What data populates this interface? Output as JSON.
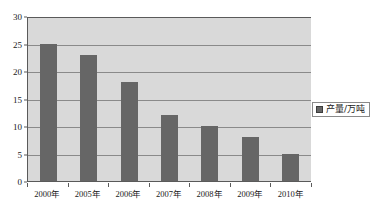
{
  "chart_data": {
    "type": "bar",
    "title": "",
    "xlabel": "",
    "ylabel": "",
    "categories": [
      "2000年",
      "2005年",
      "2006年",
      "2007年",
      "2008年",
      "2009年",
      "2010年"
    ],
    "values": [
      25,
      23,
      18,
      12,
      10,
      8,
      5
    ],
    "series": [
      {
        "name": "产量/万吨",
        "values": [
          25,
          23,
          18,
          12,
          10,
          8,
          5
        ]
      }
    ],
    "ylim": [
      0,
      30
    ],
    "yticks": [
      0,
      5,
      10,
      15,
      20,
      25,
      30
    ],
    "ytick_labels": [
      "0",
      "5",
      "10",
      "15",
      "20",
      "25",
      "30"
    ],
    "grid": true,
    "grid_axis": "y",
    "legend": {
      "position": "right",
      "entries": [
        "产量/万吨"
      ],
      "marker": "square"
    },
    "colors": {
      "bar": "#666666",
      "plot_background": "#d9d9d9",
      "canvas_background": "#ffffff",
      "gridline": "#8a8a8a",
      "axis": "#5a5a5a",
      "text": "#1a1a1a"
    }
  }
}
